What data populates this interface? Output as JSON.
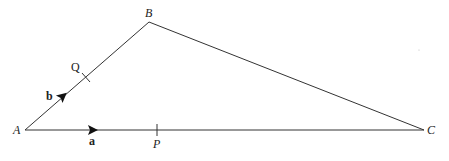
{
  "diagram": {
    "type": "triangle-vectors",
    "vertices": {
      "A": {
        "label": "A",
        "x": 25,
        "y": 130
      },
      "B": {
        "label": "B",
        "x": 149,
        "y": 22
      },
      "C": {
        "label": "C",
        "x": 424,
        "y": 130
      }
    },
    "points": {
      "P": {
        "label": "P",
        "on": "AC",
        "x": 157,
        "y": 130
      },
      "Q": {
        "label": "Q",
        "on": "AB",
        "x": 86,
        "y": 77
      }
    },
    "vectors": {
      "a": {
        "label": "a",
        "along": "AC"
      },
      "b": {
        "label": "b",
        "along": "AB"
      }
    },
    "line_color": "#333333"
  }
}
